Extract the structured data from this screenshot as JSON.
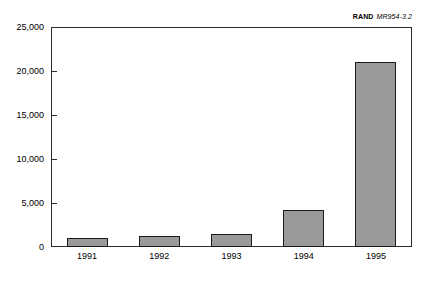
{
  "credit": {
    "organization": "RAND",
    "document_number": "MR954-3.2"
  },
  "chart_data": {
    "type": "bar",
    "title": "",
    "subtitle": "",
    "xlabel": "",
    "ylabel": "",
    "categories": [
      "1991",
      "1992",
      "1993",
      "1994",
      "1995"
    ],
    "values": [
      1000,
      1300,
      1500,
      4200,
      21000
    ],
    "series": [
      {
        "name": "",
        "values": [
          1000,
          1300,
          1500,
          4200,
          21000
        ]
      }
    ],
    "ylim": [
      0,
      25000
    ],
    "ytick_values": [
      0,
      5000,
      10000,
      15000,
      20000,
      25000
    ],
    "ytick_labels": [
      "0",
      "5,000",
      "10,000",
      "15,000",
      "20,000",
      "25,000"
    ],
    "xtick_labels": [
      "1991",
      "1992",
      "1993",
      "1994",
      "1995"
    ],
    "grid": false,
    "legend": null,
    "legend_position": "none",
    "bar_color": "#999999",
    "bar_border_color": "#1a1a1a",
    "axis_color": "#2b2b2b",
    "background_color": "#ffffff",
    "annotations": [
      "RAND MR954-3.2"
    ]
  }
}
